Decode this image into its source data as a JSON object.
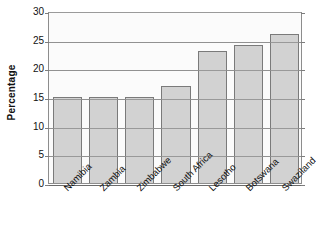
{
  "chart_data": {
    "type": "bar",
    "title": "",
    "xlabel": "",
    "ylabel": "Percentage",
    "categories": [
      "Namibia",
      "Zambia",
      "Zimbabwe",
      "South Africa",
      "Lesotho",
      "Botswana",
      "Swaziland"
    ],
    "values": [
      15,
      15,
      15,
      17,
      23,
      24,
      26
    ],
    "ylim": [
      0,
      30
    ],
    "y_ticks": [
      0,
      5,
      10,
      15,
      20,
      25,
      30
    ],
    "y_tick_labels": [
      "0",
      "5",
      "10",
      "15",
      "20",
      "25",
      "30"
    ],
    "grid": true,
    "legend": "none",
    "bar_fill_color": "#d2d2d2",
    "bar_border_color": "#7a7a7a",
    "plot_background_color": "#fbfbfb",
    "gridline_color": "#9a9a9a",
    "axis_color": "#8d8d8d"
  }
}
